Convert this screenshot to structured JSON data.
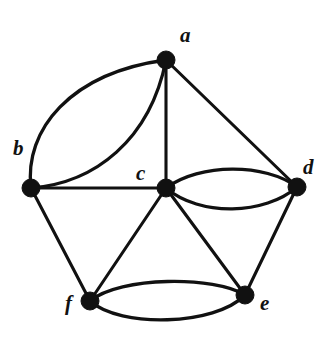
{
  "figure": {
    "background_color": "#ffffff",
    "ink_color": "#111111",
    "width": 328,
    "height": 338
  },
  "chart_data": {
    "type": "diagram",
    "subtype": "graph",
    "title": "",
    "directed": false,
    "multigraph": true,
    "vertex_radius": 9,
    "nodes": [
      {
        "id": "a",
        "label": "a",
        "x": 166,
        "y": 60,
        "label_x": 180,
        "label_y": 25,
        "degree": 5
      },
      {
        "id": "b",
        "label": "b",
        "x": 31,
        "y": 188,
        "label_x": 13,
        "label_y": 138,
        "degree": 4
      },
      {
        "id": "c",
        "label": "c",
        "x": 166,
        "y": 188,
        "label_x": 136,
        "label_y": 163,
        "degree": 6
      },
      {
        "id": "d",
        "label": "d",
        "x": 297,
        "y": 187,
        "label_x": 303,
        "label_y": 157,
        "degree": 4
      },
      {
        "id": "e",
        "label": "e",
        "x": 245,
        "y": 295,
        "label_x": 260,
        "label_y": 293,
        "degree": 4
      },
      {
        "id": "f",
        "label": "f",
        "x": 90,
        "y": 301,
        "label_x": 65,
        "label_y": 293,
        "degree": 4
      }
    ],
    "edges": [
      {
        "from": "a",
        "to": "b",
        "style": "curved",
        "bow": "outer",
        "multiplicity_index": 1
      },
      {
        "from": "a",
        "to": "b",
        "style": "curved",
        "bow": "inner",
        "multiplicity_index": 2
      },
      {
        "from": "a",
        "to": "c",
        "style": "straight"
      },
      {
        "from": "a",
        "to": "d",
        "style": "straight"
      },
      {
        "from": "b",
        "to": "c",
        "style": "straight"
      },
      {
        "from": "b",
        "to": "f",
        "style": "straight"
      },
      {
        "from": "c",
        "to": "d",
        "style": "curved",
        "bow": "upper",
        "multiplicity_index": 1
      },
      {
        "from": "c",
        "to": "d",
        "style": "curved",
        "bow": "lower",
        "multiplicity_index": 2
      },
      {
        "from": "c",
        "to": "e",
        "style": "straight"
      },
      {
        "from": "c",
        "to": "f",
        "style": "straight"
      },
      {
        "from": "d",
        "to": "e",
        "style": "straight"
      },
      {
        "from": "e",
        "to": "f",
        "style": "curved",
        "bow": "upper",
        "multiplicity_index": 1
      },
      {
        "from": "e",
        "to": "f",
        "style": "curved",
        "bow": "lower",
        "multiplicity_index": 2
      }
    ],
    "edge_paths": [
      {
        "name": "edge-a-b-outer",
        "d": "M 31 188 C 24 130 70 73 166 60"
      },
      {
        "name": "edge-a-b-inner",
        "d": "M 31 188 C 95 183 150 140 166 60"
      },
      {
        "name": "edge-a-c",
        "d": "M 166 60 L 166 188"
      },
      {
        "name": "edge-a-d",
        "d": "M 166 60 L 297 187"
      },
      {
        "name": "edge-b-c",
        "d": "M 31 188 L 166 188"
      },
      {
        "name": "edge-b-f",
        "d": "M 31 188 L 90 301"
      },
      {
        "name": "edge-c-d-upper",
        "d": "M 166 188 C 200 163 265 163 297 187"
      },
      {
        "name": "edge-c-d-lower",
        "d": "M 166 188 C 200 217 265 215 297 187"
      },
      {
        "name": "edge-c-e",
        "d": "M 166 188 L 245 295"
      },
      {
        "name": "edge-c-f",
        "d": "M 166 188 L 90 301"
      },
      {
        "name": "edge-d-e",
        "d": "M 297 187 L 245 295"
      },
      {
        "name": "edge-e-f-upper",
        "d": "M 90 301 C 120 276 215 276 245 295"
      },
      {
        "name": "edge-e-f-lower",
        "d": "M 90 301 C 120 328 215 326 245 295"
      }
    ]
  }
}
